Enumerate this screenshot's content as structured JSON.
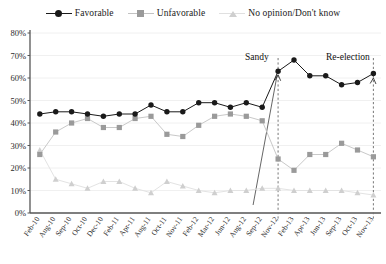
{
  "legend": {
    "items": [
      {
        "label": "Favorable",
        "color": "#1a1a1a",
        "marker": "circle",
        "icon": "legend-marker-circle-icon"
      },
      {
        "label": "Unfavorable",
        "color": "#9a9a9a",
        "marker": "square",
        "icon": "legend-marker-square-icon"
      },
      {
        "label": "No opinion/Don't know",
        "color": "#cfcfcf",
        "marker": "triangle",
        "icon": "legend-marker-triangle-icon"
      }
    ]
  },
  "annotations": [
    {
      "text": "Sandy",
      "at_category": "Nov-12",
      "label_x": 245,
      "label_y": 60
    },
    {
      "text": "Re-election",
      "at_category": "Nov-13",
      "label_x": 326,
      "label_y": 60
    }
  ],
  "chart_data": {
    "type": "line",
    "title": "",
    "xlabel": "",
    "ylabel": "",
    "ylim": [
      0,
      80
    ],
    "yticks": [
      0,
      10,
      20,
      30,
      40,
      50,
      60,
      70,
      80
    ],
    "ytick_labels": [
      "0%",
      "10%",
      "20%",
      "30%",
      "40%",
      "50%",
      "60%",
      "70%",
      "80%"
    ],
    "grid": true,
    "legend_position": "top-center",
    "categories": [
      "Feb-10",
      "Aug-10",
      "Sep-10",
      "Oct-10",
      "Dec-10",
      "Feb-11",
      "Apr-11",
      "Aug-11",
      "Oct-11",
      "Nov-11",
      "Feb-12",
      "Mar-12",
      "Jun-12",
      "Aug-12",
      "Sep-12",
      "Nov-12",
      "Feb-13",
      "Apr-13",
      "Jun-13",
      "Sep-13",
      "Oct-13",
      "Nov-13"
    ],
    "series": [
      {
        "name": "Favorable",
        "color": "#1a1a1a",
        "marker": "circle",
        "values": [
          44,
          45,
          45,
          44,
          43,
          44,
          44,
          48,
          45,
          45,
          49,
          49,
          47,
          49,
          47,
          63,
          68,
          61,
          61,
          57,
          58,
          62
        ]
      },
      {
        "name": "Unfavorable",
        "color": "#9a9a9a",
        "marker": "square",
        "values": [
          26,
          36,
          40,
          42,
          38,
          38,
          42,
          43,
          35,
          34,
          39,
          43,
          44,
          43,
          41,
          24,
          19,
          26,
          26,
          31,
          28,
          25
        ]
      },
      {
        "name": "No opinion/Don't know",
        "color": "#cfcfcf",
        "marker": "triangle",
        "values": [
          28,
          15,
          13,
          11,
          14,
          14,
          11,
          9,
          14,
          12,
          10,
          9,
          10,
          10,
          11,
          11,
          10,
          10,
          10,
          10,
          9,
          8
        ]
      }
    ]
  }
}
